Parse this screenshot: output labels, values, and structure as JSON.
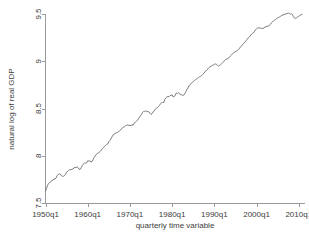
{
  "chart_data": {
    "type": "line",
    "title": "",
    "xlabel": "quarterly time variable",
    "ylabel": "natural log of real GDP",
    "grid": false,
    "legend": "none",
    "line_color": "#7a7a7a",
    "axis_color": "#9a9a9a",
    "background": "#ffffff",
    "xlim": [
      1950,
      2011
    ],
    "ylim": [
      7.5,
      9.5
    ],
    "xticks": [
      1950,
      1960,
      1970,
      1980,
      1990,
      2000,
      2010
    ],
    "xticklabels": [
      "1950q1",
      "1960q1",
      "1970q1",
      "1980q1",
      "1990q1",
      "2000q1",
      "2010q1"
    ],
    "yticks": [
      7.5,
      8,
      8.5,
      9,
      9.5
    ],
    "yticklabels": [
      "7.5",
      "8",
      "8.5",
      "9",
      "9.5"
    ],
    "series": [
      {
        "name": "natural log of real GDP",
        "x": [
          1950.0,
          1950.25,
          1950.5,
          1950.75,
          1951.0,
          1951.25,
          1951.5,
          1951.75,
          1952.0,
          1952.25,
          1952.5,
          1952.75,
          1953.0,
          1953.25,
          1953.5,
          1953.75,
          1954.0,
          1954.25,
          1954.5,
          1954.75,
          1955.0,
          1955.25,
          1955.5,
          1955.75,
          1956.0,
          1956.25,
          1956.5,
          1956.75,
          1957.0,
          1957.25,
          1957.5,
          1957.75,
          1958.0,
          1958.25,
          1958.5,
          1958.75,
          1959.0,
          1959.25,
          1959.5,
          1959.75,
          1960.0,
          1960.25,
          1960.5,
          1960.75,
          1961.0,
          1961.25,
          1961.5,
          1961.75,
          1962.0,
          1962.25,
          1962.5,
          1962.75,
          1963.0,
          1963.25,
          1963.5,
          1963.75,
          1964.0,
          1964.25,
          1964.5,
          1964.75,
          1965.0,
          1965.25,
          1965.5,
          1965.75,
          1966.0,
          1966.25,
          1966.5,
          1966.75,
          1967.0,
          1967.25,
          1967.5,
          1967.75,
          1968.0,
          1968.25,
          1968.5,
          1968.75,
          1969.0,
          1969.25,
          1969.5,
          1969.75,
          1970.0,
          1970.25,
          1970.5,
          1970.75,
          1971.0,
          1971.25,
          1971.5,
          1971.75,
          1972.0,
          1972.25,
          1972.5,
          1972.75,
          1973.0,
          1973.25,
          1973.5,
          1973.75,
          1974.0,
          1974.25,
          1974.5,
          1974.75,
          1975.0,
          1975.25,
          1975.5,
          1975.75,
          1976.0,
          1976.25,
          1976.5,
          1976.75,
          1977.0,
          1977.25,
          1977.5,
          1977.75,
          1978.0,
          1978.25,
          1978.5,
          1978.75,
          1979.0,
          1979.25,
          1979.5,
          1979.75,
          1980.0,
          1980.25,
          1980.5,
          1980.75,
          1981.0,
          1981.25,
          1981.5,
          1981.75,
          1982.0,
          1982.25,
          1982.5,
          1982.75,
          1983.0,
          1983.25,
          1983.5,
          1983.75,
          1984.0,
          1984.25,
          1984.5,
          1984.75,
          1985.0,
          1985.25,
          1985.5,
          1985.75,
          1986.0,
          1986.25,
          1986.5,
          1986.75,
          1987.0,
          1987.25,
          1987.5,
          1987.75,
          1988.0,
          1988.25,
          1988.5,
          1988.75,
          1989.0,
          1989.25,
          1989.5,
          1989.75,
          1990.0,
          1990.25,
          1990.5,
          1990.75,
          1991.0,
          1991.25,
          1991.5,
          1991.75,
          1992.0,
          1992.25,
          1992.5,
          1992.75,
          1993.0,
          1993.25,
          1993.5,
          1993.75,
          1994.0,
          1994.25,
          1994.5,
          1994.75,
          1995.0,
          1995.25,
          1995.5,
          1995.75,
          1996.0,
          1996.25,
          1996.5,
          1996.75,
          1997.0,
          1997.25,
          1997.5,
          1997.75,
          1998.0,
          1998.25,
          1998.5,
          1998.75,
          1999.0,
          1999.25,
          1999.5,
          1999.75,
          2000.0,
          2000.25,
          2000.5,
          2000.75,
          2001.0,
          2001.25,
          2001.5,
          2001.75,
          2002.0,
          2002.25,
          2002.5,
          2002.75,
          2003.0,
          2003.25,
          2003.5,
          2003.75,
          2004.0,
          2004.25,
          2004.5,
          2004.75,
          2005.0,
          2005.25,
          2005.5,
          2005.75,
          2006.0,
          2006.25,
          2006.5,
          2006.75,
          2007.0,
          2007.25,
          2007.5,
          2007.75,
          2008.0,
          2008.25,
          2008.5,
          2008.75,
          2009.0,
          2009.25,
          2009.5,
          2009.75,
          2010.0,
          2010.25,
          2010.5,
          2010.75
        ],
        "values": [
          7.625,
          7.655,
          7.688,
          7.708,
          7.717,
          7.726,
          7.733,
          7.748,
          7.752,
          7.754,
          7.764,
          7.791,
          7.801,
          7.809,
          7.806,
          7.79,
          7.784,
          7.782,
          7.79,
          7.805,
          7.826,
          7.838,
          7.846,
          7.854,
          7.852,
          7.856,
          7.86,
          7.872,
          7.876,
          7.876,
          7.883,
          7.874,
          7.855,
          7.857,
          7.877,
          7.899,
          7.913,
          7.925,
          7.922,
          7.925,
          7.947,
          7.944,
          7.946,
          7.934,
          7.938,
          7.958,
          7.98,
          7.996,
          8.012,
          8.023,
          8.029,
          8.038,
          8.047,
          8.062,
          8.077,
          8.086,
          8.1,
          8.111,
          8.12,
          8.125,
          8.148,
          8.162,
          8.179,
          8.2,
          8.219,
          8.228,
          8.236,
          8.241,
          8.245,
          8.254,
          8.259,
          8.271,
          8.284,
          8.297,
          8.303,
          8.308,
          8.318,
          8.322,
          8.327,
          8.322,
          8.32,
          8.32,
          8.328,
          8.323,
          8.345,
          8.353,
          8.362,
          8.375,
          8.39,
          8.409,
          8.421,
          8.438,
          8.46,
          8.468,
          8.469,
          8.476,
          8.467,
          8.468,
          8.464,
          8.449,
          8.437,
          8.446,
          8.465,
          8.473,
          8.49,
          8.503,
          8.508,
          8.52,
          8.533,
          8.55,
          8.562,
          8.564,
          8.562,
          8.597,
          8.612,
          8.622,
          8.627,
          8.625,
          8.637,
          8.639,
          8.644,
          8.622,
          8.626,
          8.643,
          8.665,
          8.656,
          8.666,
          8.661,
          8.644,
          8.645,
          8.64,
          8.641,
          8.655,
          8.679,
          8.7,
          8.717,
          8.74,
          8.755,
          8.765,
          8.774,
          8.785,
          8.794,
          8.806,
          8.811,
          8.82,
          8.825,
          8.838,
          8.841,
          8.849,
          8.861,
          8.871,
          8.887,
          8.897,
          8.91,
          8.92,
          8.933,
          8.943,
          8.948,
          8.957,
          8.96,
          8.968,
          8.971,
          8.968,
          8.954,
          8.949,
          8.957,
          8.964,
          8.975,
          8.987,
          9.0,
          9.008,
          9.022,
          9.022,
          9.031,
          9.038,
          9.053,
          9.064,
          9.077,
          9.085,
          9.098,
          9.101,
          9.106,
          9.116,
          9.124,
          9.139,
          9.156,
          9.165,
          9.181,
          9.192,
          9.205,
          9.216,
          9.232,
          9.246,
          9.256,
          9.268,
          9.285,
          9.293,
          9.3,
          9.315,
          9.334,
          9.343,
          9.354,
          9.351,
          9.354,
          9.351,
          9.347,
          9.348,
          9.352,
          9.361,
          9.366,
          9.371,
          9.372,
          9.376,
          9.39,
          9.405,
          9.416,
          9.427,
          9.434,
          9.442,
          9.45,
          9.459,
          9.464,
          9.471,
          9.477,
          9.486,
          9.49,
          9.493,
          9.499,
          9.501,
          9.506,
          9.51,
          9.506,
          9.498,
          9.502,
          9.494,
          9.472,
          9.457,
          9.452,
          9.461,
          9.47,
          9.476,
          9.485,
          9.491,
          9.497
        ]
      }
    ]
  }
}
